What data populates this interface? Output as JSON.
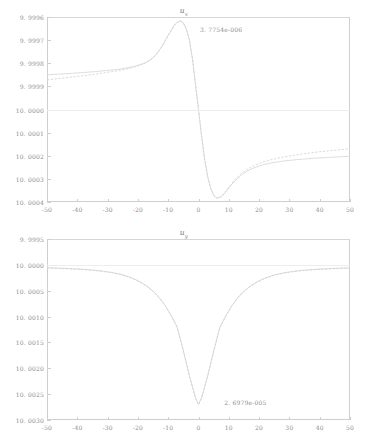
{
  "figure": {
    "background": "#ffffff",
    "curve_color": "#d9d9d9",
    "axis_color": "#cfcfcf",
    "text_color": "#8d8d8d"
  },
  "chart_data": [
    {
      "type": "line",
      "title": "u",
      "title_subscript": "x",
      "xlabel": "",
      "ylabel": "",
      "xlim": [
        -50,
        50
      ],
      "ylim": [
        9.9996,
        10.0004
      ],
      "y_inverted": true,
      "grid": false,
      "xticks": [
        -50,
        -40,
        -30,
        -20,
        -10,
        0,
        10,
        20,
        30,
        40,
        50
      ],
      "xticklabels": [
        "-50",
        "-40",
        "-30",
        "-20",
        "-10",
        "0",
        "10",
        "20",
        "30",
        "40",
        "50"
      ],
      "yticks": [
        9.9996,
        9.9997,
        9.9998,
        9.9999,
        10.0,
        10.0001,
        10.0002,
        10.0003,
        10.0004
      ],
      "yticklabels": [
        "9. 9996",
        "9. 9997",
        "9. 9998",
        "9. 9999",
        "10. 0000",
        "10. 0001",
        "10. 0002",
        "10. 0003",
        "10. 0004"
      ],
      "annotations": [
        {
          "text": "3. 7754e-006",
          "x": -1.5,
          "y": 9.99965
        }
      ],
      "series": [
        {
          "name": "reference",
          "style": "solid",
          "x": [
            -50,
            -46,
            -42,
            -38,
            -34,
            -30,
            -27,
            -24,
            -21,
            -18,
            -16,
            -14,
            -12,
            -10,
            -8,
            -7,
            -6,
            -5,
            -4,
            -3,
            -2,
            -1,
            0,
            1,
            2,
            3,
            4,
            5,
            6,
            7,
            8,
            9,
            10,
            12,
            14,
            16,
            18,
            21,
            24,
            27,
            30,
            34,
            38,
            42,
            46,
            50
          ],
          "y": [
            9.99985,
            9.999847,
            9.999844,
            9.99984,
            9.999836,
            9.999831,
            9.999827,
            9.999821,
            9.999813,
            9.9998,
            9.999786,
            9.999763,
            9.999726,
            9.999679,
            9.999636,
            9.999622,
            9.999617,
            9.999625,
            9.999652,
            9.9997,
            9.99978,
            9.99989,
            10.0,
            10.000113,
            10.000213,
            10.000289,
            10.000341,
            10.000371,
            10.000383,
            10.000381,
            10.000371,
            10.000356,
            10.000339,
            10.000309,
            10.000285,
            10.000267,
            10.000254,
            10.00024,
            10.000231,
            10.000225,
            10.00022,
            10.000215,
            10.000211,
            10.000208,
            10.000205,
            10.000202
          ]
        },
        {
          "name": "computed",
          "style": "dashed",
          "x": [
            -50,
            -46,
            -42,
            -38,
            -34,
            -30,
            -27,
            -24,
            -21,
            -18,
            -16,
            -14,
            -12,
            -10,
            -8,
            -7,
            -6,
            -5,
            -4,
            -3,
            -2,
            -1,
            0,
            1,
            2,
            3,
            4,
            5,
            6,
            7,
            8,
            9,
            10,
            12,
            14,
            16,
            18,
            21,
            24,
            27,
            30,
            34,
            38,
            42,
            46,
            50
          ],
          "y": [
            9.999872,
            9.999866,
            9.99986,
            9.999854,
            9.999847,
            9.999839,
            9.999833,
            9.999826,
            9.999816,
            9.999802,
            9.999788,
            9.999764,
            9.999727,
            9.99968,
            9.999637,
            9.999623,
            9.999618,
            9.999626,
            9.999653,
            9.999701,
            9.999781,
            9.999891,
            10.0,
            10.000112,
            10.000212,
            10.000288,
            10.00034,
            10.00037,
            10.000382,
            10.00038,
            10.00037,
            10.000354,
            10.000336,
            10.000304,
            10.000278,
            10.000259,
            10.000245,
            10.000228,
            10.000217,
            10.000208,
            10.000201,
            10.000193,
            10.000186,
            10.00018,
            10.000175,
            10.00017
          ]
        }
      ]
    },
    {
      "type": "line",
      "title": "u",
      "title_subscript": "y",
      "xlabel": "",
      "ylabel": "",
      "xlim": [
        -50,
        50
      ],
      "ylim": [
        9.9995,
        10.003
      ],
      "y_inverted": true,
      "grid": false,
      "xticks": [
        -50,
        -40,
        -30,
        -20,
        -10,
        0,
        10,
        20,
        30,
        40,
        50
      ],
      "xticklabels": [
        "-50",
        "-40",
        "-30",
        "-20",
        "-10",
        "0",
        "10",
        "20",
        "30",
        "40",
        "50"
      ],
      "yticks": [
        9.9995,
        10.0,
        10.0005,
        10.001,
        10.0015,
        10.002,
        10.0025,
        10.003
      ],
      "yticklabels": [
        "9. 9995",
        "10. 0000",
        "10. 0005",
        "10. 0010",
        "10. 0015",
        "10. 0020",
        "10. 0025",
        "10. 0030"
      ],
      "annotations": [
        {
          "text": "2. 6979e-005",
          "x": 6.5,
          "y": 10.00266
        }
      ],
      "series": [
        {
          "name": "reference",
          "style": "solid",
          "x": [
            -50,
            -46,
            -43,
            -40,
            -37,
            -34,
            -31,
            -28,
            -25,
            -22,
            -19,
            -17,
            -15,
            -13,
            -11,
            -9,
            -7,
            -5,
            -3,
            -1,
            0,
            1,
            3,
            5,
            7,
            9,
            11,
            13,
            15,
            17,
            19,
            22,
            25,
            28,
            31,
            34,
            37,
            40,
            43,
            46,
            50
          ],
          "y": [
            10.000055,
            10.000063,
            10.00007,
            10.000079,
            10.00009,
            10.000105,
            10.000125,
            10.000153,
            10.000193,
            10.000251,
            10.000336,
            10.000411,
            10.000506,
            10.000629,
            10.000784,
            10.000977,
            10.001208,
            10.001658,
            10.002144,
            10.002569,
            10.002698,
            10.002574,
            10.002152,
            10.001668,
            10.001216,
            10.000984,
            10.000789,
            10.000633,
            10.000509,
            10.000414,
            10.000338,
            10.000253,
            10.000195,
            10.000155,
            10.000127,
            10.000107,
            10.000092,
            10.000081,
            10.000072,
            10.000065,
            10.000057
          ]
        },
        {
          "name": "computed",
          "style": "dashed",
          "x": [
            -50,
            -46,
            -43,
            -40,
            -37,
            -34,
            -31,
            -28,
            -25,
            -22,
            -19,
            -17,
            -15,
            -13,
            -11,
            -9,
            -7,
            -5,
            -3,
            -1,
            0,
            1,
            3,
            5,
            7,
            9,
            11,
            13,
            15,
            17,
            19,
            22,
            25,
            28,
            31,
            34,
            37,
            40,
            43,
            46,
            50
          ],
          "y": [
            10.000062,
            10.00007,
            10.000077,
            10.000086,
            10.000097,
            10.000112,
            10.000132,
            10.00016,
            10.0002,
            10.000258,
            10.000343,
            10.000418,
            10.000513,
            10.000636,
            10.000791,
            10.000984,
            10.001215,
            10.001665,
            10.002151,
            10.002576,
            10.002705,
            10.002581,
            10.002159,
            10.001675,
            10.001223,
            10.000991,
            10.000796,
            10.00064,
            10.000516,
            10.000421,
            10.000345,
            10.00026,
            10.000202,
            10.000162,
            10.000134,
            10.000114,
            10.000099,
            10.000088,
            10.000079,
            10.000072,
            10.000064
          ]
        }
      ]
    }
  ]
}
